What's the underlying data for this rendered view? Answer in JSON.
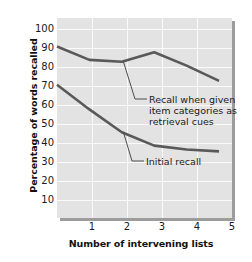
{
  "chart_data": {
    "type": "line",
    "title": "",
    "xlabel": "Number of intervening lists",
    "ylabel": "Percentage of words recalled",
    "x": [
      0,
      1,
      2,
      3,
      4,
      5
    ],
    "xtick_labels": [
      "1",
      "2",
      "3",
      "4",
      "5"
    ],
    "xtick_values": [
      1,
      2,
      3,
      4,
      5
    ],
    "xlim": [
      0,
      5.4
    ],
    "ylim": [
      0,
      105
    ],
    "ytick_labels": [
      "100",
      "90",
      "80",
      "70",
      "60",
      "50",
      "40",
      "30",
      "20",
      "10"
    ],
    "ytick_values": [
      100,
      90,
      80,
      70,
      60,
      50,
      40,
      30,
      20,
      10
    ],
    "grid": true,
    "legend_position": "inline-annotations",
    "series": [
      {
        "name": "Recall when given item categories as retrieval cues",
        "values": [
          90,
          83,
          82,
          87,
          80,
          72
        ],
        "color": "#595959"
      },
      {
        "name": "Initial recall",
        "values": [
          70,
          57,
          45,
          38,
          36,
          35
        ],
        "color": "#595959"
      }
    ],
    "annotations": [
      {
        "id": "cued",
        "text": "Recall when given\nitem categories as\nretrieval cues",
        "leader_from_x": 2.05,
        "leader_from_y": 82
      },
      {
        "id": "initial",
        "text": "Initial recall",
        "leader_from_x": 2.05,
        "leader_from_y": 45
      }
    ],
    "colors": {
      "panel_background": "#e3e3e3",
      "gridline": "#fbfbfb",
      "line": "#595959",
      "text": "#1a1a1a",
      "shadow": "#9c9c9c",
      "page_background": "#ffffff"
    }
  }
}
